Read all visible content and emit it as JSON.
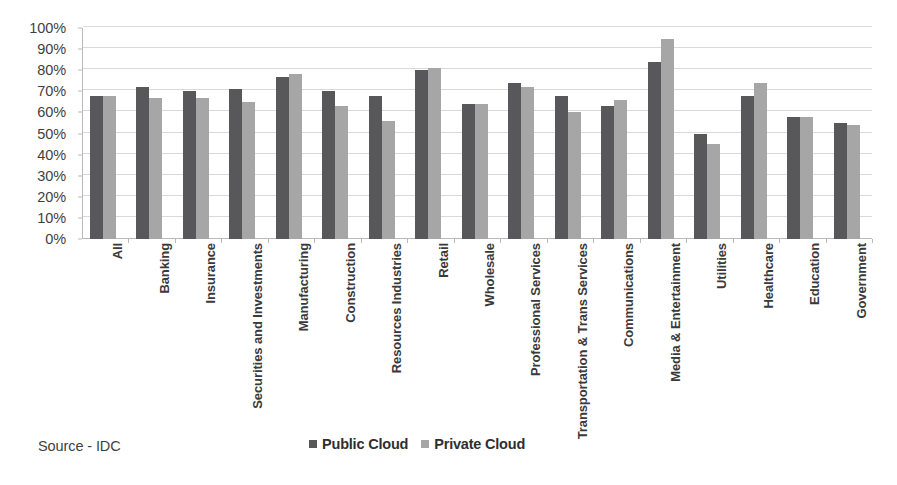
{
  "source_note": "Source - IDC",
  "legend": {
    "position": "bottom-center",
    "items": [
      {
        "label": "Public Cloud",
        "color": "#58585a",
        "marker": "square-swatch-icon"
      },
      {
        "label": "Private Cloud",
        "color": "#a6a6a6",
        "marker": "square-swatch-icon"
      }
    ]
  },
  "y_axis": {
    "ticks": [
      "0%",
      "10%",
      "20%",
      "30%",
      "40%",
      "50%",
      "60%",
      "70%",
      "80%",
      "90%",
      "100%"
    ]
  },
  "chart_data": {
    "type": "bar",
    "title": "",
    "subtitle": "",
    "xlabel": "",
    "ylabel": "",
    "ylim": [
      0,
      100
    ],
    "ytick_step": 10,
    "grid": true,
    "legend_position": "bottom-center",
    "annotations": [
      "Source - IDC"
    ],
    "categories": [
      "All",
      "Banking",
      "Insurance",
      "Securities and Investments",
      "Manufacturing",
      "Construction",
      "Resources Industries",
      "Retail",
      "Wholesale",
      "Professional Services",
      "Transportation & Trans Services",
      "Communications",
      "Media & Entertainment",
      "Utilities",
      "Healthcare",
      "Education",
      "Government"
    ],
    "series": [
      {
        "name": "Public Cloud",
        "color": "#58585a",
        "values": [
          68,
          72,
          70,
          71,
          77,
          70,
          68,
          80,
          64,
          74,
          68,
          63,
          84,
          50,
          68,
          58,
          55
        ]
      },
      {
        "name": "Private Cloud",
        "color": "#a6a6a6",
        "values": [
          68,
          67,
          67,
          65,
          78,
          63,
          56,
          81,
          64,
          72,
          60,
          66,
          95,
          45,
          74,
          58,
          54
        ]
      }
    ]
  }
}
